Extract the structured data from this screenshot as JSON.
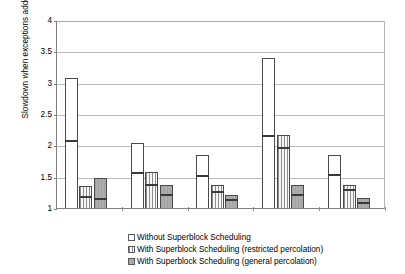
{
  "chart_data": {
    "type": "bar",
    "title": "",
    "xlabel": "",
    "ylabel": "Slowdown when exceptions added",
    "ylim": [
      1,
      4
    ],
    "ytick_labels": [
      "4",
      "3.5",
      "3",
      "2.5",
      "2",
      "1.5",
      "1"
    ],
    "ytick_values": [
      4,
      3.5,
      3,
      2.5,
      2,
      1.5,
      1
    ],
    "grid": true,
    "grid_axis": "y",
    "legend_position": "bottom",
    "categories": [
      "matrix",
      "euler",
      "mergesort",
      "graycodes",
      "binary"
    ],
    "series": [
      {
        "name": "Without Superblock Scheduling",
        "fill": "plain",
        "values": [
          3.08,
          2.03,
          1.84,
          3.4,
          1.84
        ],
        "inner_values": [
          2.08,
          1.58,
          1.52,
          2.16,
          1.55
        ]
      },
      {
        "name": "With Superblock Scheduling (restricted percolation)",
        "fill": "vertical-stripes",
        "values": [
          1.35,
          1.58,
          1.37,
          2.17,
          1.37
        ],
        "inner_values": [
          1.19,
          1.38,
          1.27,
          1.98,
          1.3
        ]
      },
      {
        "name": "With Superblock Scheduling (general percolation)",
        "fill": "gray",
        "values": [
          1.48,
          1.36,
          1.21,
          1.36,
          1.16
        ],
        "inner_values": [
          1.16,
          1.22,
          1.15,
          1.23,
          1.1
        ]
      }
    ]
  },
  "axis": {
    "y_title": "Slowdown when exceptions added",
    "ticks": [
      {
        "label": "4"
      },
      {
        "label": "3.5"
      },
      {
        "label": "3"
      },
      {
        "label": "2.5"
      },
      {
        "label": "2"
      },
      {
        "label": "1.5"
      },
      {
        "label": "1"
      }
    ]
  },
  "categories": [
    {
      "label": "matrix"
    },
    {
      "label": "euler"
    },
    {
      "label": "mergesort"
    },
    {
      "label": "graycodes"
    },
    {
      "label": "binary"
    }
  ],
  "legend": {
    "items": [
      {
        "label": "Without Superblock Scheduling"
      },
      {
        "label": "With Superblock Scheduling (restricted percolation)"
      },
      {
        "label": "With Superblock Scheduling (general percolation)"
      }
    ]
  }
}
